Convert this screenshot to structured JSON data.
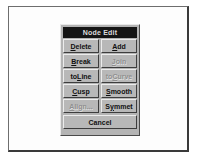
{
  "dialog": {
    "title": "Node Edit",
    "rows": [
      [
        {
          "name": "delete-button",
          "label": "Delete",
          "accel": "D",
          "enabled": true
        },
        {
          "name": "add-button",
          "label": "Add",
          "accel": "A",
          "enabled": true
        }
      ],
      [
        {
          "name": "break-button",
          "label": "Break",
          "accel": "B",
          "enabled": true
        },
        {
          "name": "join-button",
          "label": "Join",
          "accel": "J",
          "enabled": false
        }
      ],
      [
        {
          "name": "toline-button",
          "label": "toLine",
          "accel": "L",
          "enabled": true
        },
        {
          "name": "tocurve-button",
          "label": "toCurve",
          "accel": "C",
          "enabled": false
        }
      ],
      [
        {
          "name": "cusp-button",
          "label": "Cusp",
          "accel": "C",
          "enabled": true
        },
        {
          "name": "smooth-button",
          "label": "Smooth",
          "accel": "S",
          "enabled": true
        }
      ],
      [
        {
          "name": "align-button",
          "label": "Align...",
          "accel": "A",
          "enabled": false
        },
        {
          "name": "symmet-button",
          "label": "Symmet",
          "accel": "y",
          "enabled": true
        }
      ]
    ],
    "cancel": {
      "name": "cancel-button",
      "label": "Cancel",
      "enabled": true
    }
  },
  "colors": {
    "titlebar_background": "#151515",
    "titlebar_text": "#dcdcdc",
    "dialog_face": "#b4b4b4",
    "button_face": "#b8b8b8",
    "button_text": "#101010",
    "button_text_disabled": "#8f8f8f",
    "page_background": "#ffffff",
    "frame_border": "#3a3a3a"
  }
}
